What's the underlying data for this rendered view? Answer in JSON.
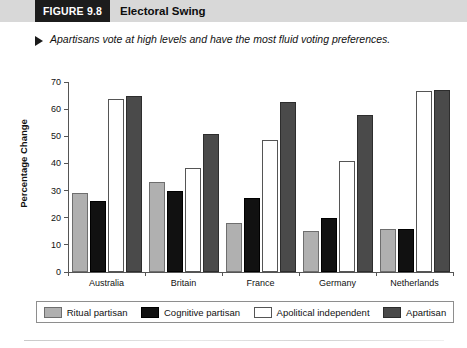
{
  "header": {
    "figure_tag": "FIGURE 9.8",
    "figure_title": "Electoral Swing",
    "tag_background": "#1c1c1c",
    "band_background": "#d8d8d8"
  },
  "caption": {
    "bullet_icon": "triangle-right-icon",
    "text": "Apartisans vote at high levels and have the most fluid voting preferences."
  },
  "chart_data": {
    "type": "bar",
    "title": "Electoral Swing",
    "xlabel": "",
    "ylabel": "Percentage Change",
    "ylim": [
      0,
      70
    ],
    "yticks": [
      0,
      10,
      20,
      30,
      40,
      50,
      60,
      70
    ],
    "grid": false,
    "legend_position": "bottom",
    "categories": [
      "Australia",
      "Britain",
      "France",
      "Germany",
      "Netherlands"
    ],
    "series": [
      {
        "name": "Ritual partisan",
        "color": "#b0b0b0",
        "values": [
          28.5,
          32.5,
          17.5,
          14.5,
          15.0
        ]
      },
      {
        "name": "Cognitive partisan",
        "color": "#111111",
        "values": [
          25.5,
          29.0,
          26.5,
          19.0,
          15.0
        ]
      },
      {
        "name": "Apolitical independent",
        "color": "#ffffff",
        "values": [
          63.0,
          37.5,
          48.0,
          40.0,
          66.0
        ]
      },
      {
        "name": "Apartisan",
        "color": "#4a4a4a",
        "values": [
          64.0,
          50.0,
          62.0,
          57.0,
          66.5
        ]
      }
    ]
  }
}
